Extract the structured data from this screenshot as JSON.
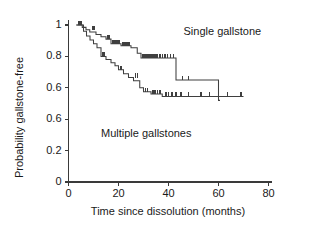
{
  "chart_data": {
    "type": "line",
    "subtype": "kaplan-meier-step",
    "title": "",
    "xlabel": "Time since dissolution (months)",
    "ylabel": "Probability gallstone-free",
    "xlim": [
      0,
      80
    ],
    "ylim": [
      0,
      1.04
    ],
    "grid": false,
    "legend": "inline-annotations",
    "xticks": [
      0,
      20,
      40,
      60,
      80
    ],
    "xtick_labels": [
      "0",
      "20",
      "40",
      "60",
      "80"
    ],
    "yticks": [
      1.0,
      0.8,
      0.6,
      0.4,
      0.2,
      0.0
    ],
    "ytick_labels": [
      "1",
      "0.8",
      "0.6",
      "0.6",
      "0.2",
      "0"
    ],
    "series": [
      {
        "name": "Single gallstone",
        "label_x": 46,
        "label_y": 0.955,
        "points": [
          [
            3.0,
            1.0
          ],
          [
            5.5,
            1.0
          ],
          [
            5.5,
            0.985
          ],
          [
            7.0,
            0.985
          ],
          [
            7.0,
            0.97
          ],
          [
            8.5,
            0.97
          ],
          [
            8.5,
            0.955
          ],
          [
            11.0,
            0.955
          ],
          [
            11.0,
            0.94
          ],
          [
            13.0,
            0.94
          ],
          [
            13.0,
            0.925
          ],
          [
            15.0,
            0.925
          ],
          [
            15.0,
            0.91
          ],
          [
            17.0,
            0.91
          ],
          [
            17.0,
            0.88
          ],
          [
            21.0,
            0.88
          ],
          [
            21.0,
            0.868
          ],
          [
            25.0,
            0.868
          ],
          [
            25.0,
            0.855
          ],
          [
            27.5,
            0.855
          ],
          [
            27.5,
            0.82
          ],
          [
            29.0,
            0.82
          ],
          [
            29.0,
            0.79
          ],
          [
            43.0,
            0.79
          ],
          [
            43.0,
            0.65
          ],
          [
            60.0,
            0.65
          ],
          [
            60.0,
            0.52
          ],
          [
            60.6,
            0.52
          ]
        ],
        "censor_marks": [
          [
            4.0,
            1.0
          ],
          [
            4.7,
            1.0
          ],
          [
            5.2,
            1.0
          ],
          [
            9.5,
            0.97
          ],
          [
            10.2,
            0.97
          ],
          [
            15.8,
            0.91
          ],
          [
            16.4,
            0.91
          ],
          [
            17.8,
            0.88
          ],
          [
            18.6,
            0.88
          ],
          [
            19.4,
            0.88
          ],
          [
            20.2,
            0.88
          ],
          [
            21.8,
            0.868
          ],
          [
            22.6,
            0.868
          ],
          [
            23.4,
            0.868
          ],
          [
            24.2,
            0.868
          ],
          [
            29.8,
            0.79
          ],
          [
            30.6,
            0.79
          ],
          [
            31.4,
            0.79
          ],
          [
            32.2,
            0.79
          ],
          [
            33.0,
            0.79
          ],
          [
            33.8,
            0.79
          ],
          [
            34.6,
            0.79
          ],
          [
            35.4,
            0.79
          ],
          [
            36.6,
            0.79
          ],
          [
            37.6,
            0.79
          ],
          [
            38.6,
            0.79
          ],
          [
            39.6,
            0.79
          ],
          [
            40.8,
            0.79
          ],
          [
            42.0,
            0.79
          ],
          [
            45.5,
            0.65
          ],
          [
            48.0,
            0.65
          ]
        ]
      },
      {
        "name": "Multiple gallstones",
        "label_x": 13,
        "label_y": 0.305,
        "points": [
          [
            3.5,
            1.0
          ],
          [
            6.0,
            1.0
          ],
          [
            6.0,
            0.96
          ],
          [
            7.2,
            0.96
          ],
          [
            7.2,
            0.93
          ],
          [
            8.6,
            0.93
          ],
          [
            8.6,
            0.905
          ],
          [
            10.0,
            0.905
          ],
          [
            10.0,
            0.88
          ],
          [
            11.4,
            0.88
          ],
          [
            11.4,
            0.855
          ],
          [
            13.0,
            0.855
          ],
          [
            13.0,
            0.8
          ],
          [
            15.0,
            0.8
          ],
          [
            15.0,
            0.78
          ],
          [
            17.0,
            0.78
          ],
          [
            17.0,
            0.76
          ],
          [
            18.6,
            0.76
          ],
          [
            18.6,
            0.74
          ],
          [
            20.0,
            0.74
          ],
          [
            20.0,
            0.715
          ],
          [
            22.0,
            0.715
          ],
          [
            22.0,
            0.69
          ],
          [
            24.0,
            0.69
          ],
          [
            24.0,
            0.665
          ],
          [
            26.0,
            0.665
          ],
          [
            26.0,
            0.645
          ],
          [
            28.5,
            0.645
          ],
          [
            28.5,
            0.6
          ],
          [
            30.0,
            0.6
          ],
          [
            30.0,
            0.575
          ],
          [
            33.0,
            0.575
          ],
          [
            33.0,
            0.56
          ],
          [
            37.5,
            0.56
          ],
          [
            37.5,
            0.545
          ],
          [
            70.0,
            0.545
          ]
        ],
        "censor_marks": [
          [
            4.3,
            1.0
          ],
          [
            5.1,
            1.0
          ],
          [
            13.8,
            0.8
          ],
          [
            14.5,
            0.8
          ],
          [
            21.0,
            0.715
          ],
          [
            26.8,
            0.665
          ],
          [
            27.6,
            0.665
          ],
          [
            30.8,
            0.575
          ],
          [
            31.6,
            0.575
          ],
          [
            33.8,
            0.56
          ],
          [
            34.6,
            0.56
          ],
          [
            35.6,
            0.56
          ],
          [
            36.6,
            0.56
          ],
          [
            39.0,
            0.545
          ],
          [
            40.0,
            0.545
          ],
          [
            41.4,
            0.545
          ],
          [
            43.0,
            0.545
          ],
          [
            45.0,
            0.545
          ],
          [
            48.0,
            0.545
          ],
          [
            53.0,
            0.545
          ],
          [
            56.5,
            0.545
          ],
          [
            63.5,
            0.545
          ],
          [
            69.0,
            0.545
          ]
        ]
      }
    ]
  },
  "axes": {
    "x_title": "Time since dissolution (months)",
    "y_title": "Probability gallstone-free"
  },
  "colors": {
    "curve": "#3f3f3f",
    "axis": "#3a3a3a",
    "text": "#1a1a1a",
    "background": "#ffffff"
  }
}
